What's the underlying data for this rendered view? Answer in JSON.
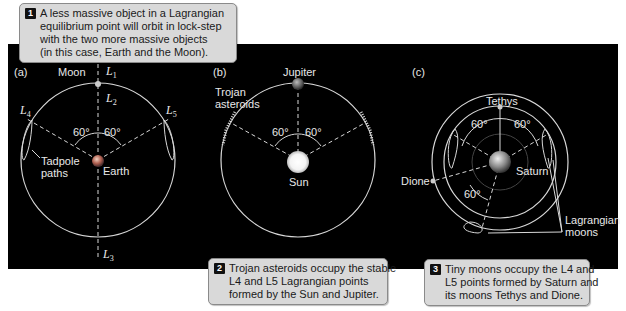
{
  "callouts": [
    {
      "num": "1",
      "lines": [
        "A less massive object in a Lagrangian",
        "equilibrium point will orbit in lock-step",
        "with the two more massive objects",
        "(in this case, Earth and the Moon)."
      ]
    },
    {
      "num": "2",
      "lines": [
        "Trojan asteroids occupy the stable",
        "L4 and L5 Lagrangian points",
        "formed by the Sun and Jupiter."
      ]
    },
    {
      "num": "3",
      "lines": [
        "Tiny moons occupy the L4 and",
        "L5 points formed by Saturn and",
        "its moons Tethys and Dione."
      ]
    }
  ],
  "panel_a": {
    "tag": "(a)",
    "moon": "Moon",
    "earth": "Earth",
    "tadpole": [
      "Tadpole",
      "paths"
    ],
    "L1": "L",
    "L1s": "1",
    "L2": "L",
    "L2s": "2",
    "L3": "L",
    "L3s": "3",
    "L4": "L",
    "L4s": "4",
    "L5": "L",
    "L5s": "5",
    "angle_left": "60°",
    "angle_right": "60°"
  },
  "panel_b": {
    "tag": "(b)",
    "jupiter": "Jupiter",
    "sun": "Sun",
    "trojan": [
      "Trojan",
      "asteroids"
    ],
    "angle_left": "60°",
    "angle_right": "60°"
  },
  "panel_c": {
    "tag": "(c)",
    "tethys": "Tethys",
    "saturn": "Saturn",
    "dione": "Dione",
    "lagrangian": [
      "Lagrangian",
      "moons"
    ],
    "angle_left": "60°",
    "angle_right": "60°",
    "angle_bottom": "60°"
  },
  "colors": {
    "panel_bg": "#000000",
    "orbit": "#d8d8d8",
    "callout_bg": "#d9d9d9"
  }
}
